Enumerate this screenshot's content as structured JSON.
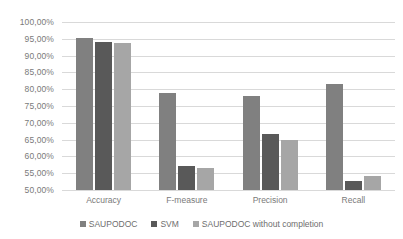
{
  "chart_data": {
    "type": "bar",
    "title": "",
    "xlabel": "",
    "ylabel": "",
    "categories": [
      "Accuracy",
      "F-measure",
      "Precision",
      "Recall"
    ],
    "series": [
      {
        "name": "SAUPODOC",
        "color": "#808080",
        "values": [
          95.2,
          79.0,
          78.0,
          81.5
        ]
      },
      {
        "name": "SVM",
        "color": "#595959",
        "values": [
          94.0,
          57.0,
          66.7,
          52.8
        ]
      },
      {
        "name": "SAUPODOC without completion",
        "color": "#a6a6a6",
        "values": [
          93.8,
          56.5,
          65.0,
          54.2
        ]
      }
    ],
    "ylim": [
      50,
      100
    ],
    "ytick_step": 5,
    "ytick_labels": [
      "100,00%",
      "95,00%",
      "90,00%",
      "85,00%",
      "80,00%",
      "75,00%",
      "70,00%",
      "65,00%",
      "60,00%",
      "55,00%",
      "50,00%"
    ],
    "grid": "horizontal",
    "legend_position": "bottom",
    "gridline_color": "#d9d9d9",
    "tick_text_color": "#7a7a7a"
  }
}
